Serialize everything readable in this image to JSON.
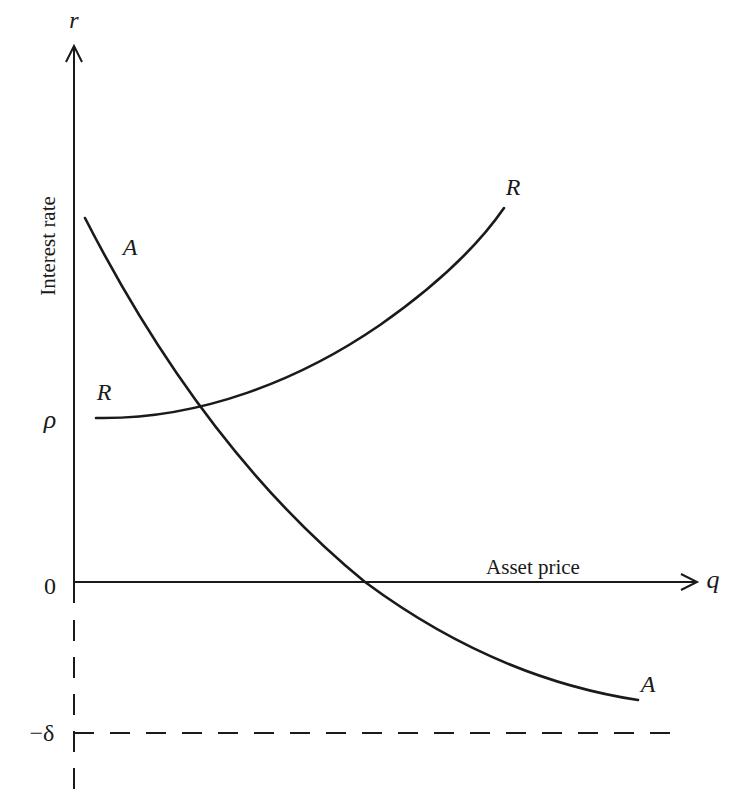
{
  "diagram": {
    "y_axis": {
      "symbol": "r",
      "label": "Interest rate"
    },
    "x_axis": {
      "symbol": "q",
      "label": "Asset price"
    },
    "tick_labels": {
      "rho": "ρ",
      "zero": "0",
      "minus_delta": "−δ"
    },
    "curves": [
      {
        "id": "A",
        "start_label": "A",
        "end_label": "A",
        "shape": "downward-sloping convex"
      },
      {
        "id": "R",
        "start_label": "R",
        "end_label": "R",
        "shape": "upward-sloping convex, starts at rho"
      }
    ],
    "reference_lines": [
      {
        "label": "−δ",
        "style": "dashed horizontal"
      },
      {
        "label": "negative r-axis",
        "style": "dashed vertical"
      }
    ],
    "colors": {
      "ink": "#1a1a1a",
      "background": "#ffffff"
    }
  }
}
